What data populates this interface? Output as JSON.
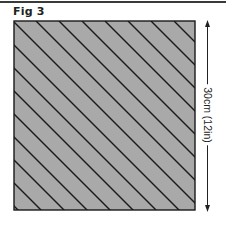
{
  "figure": {
    "title": "Fig 3",
    "dimension_label": "30cm (12in)",
    "colors": {
      "fill": "#a9a9a9",
      "stroke": "#1a1a1a",
      "text": "#222222"
    }
  }
}
